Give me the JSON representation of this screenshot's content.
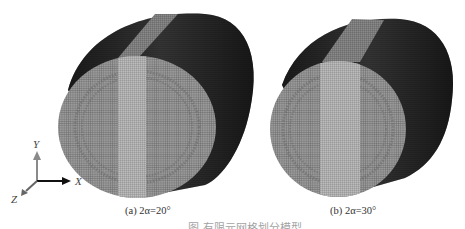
{
  "figure": {
    "panels": [
      {
        "id": "a",
        "label_prefix": "(a)",
        "label_value": "2α=20°",
        "band_angle_deg": 20
      },
      {
        "id": "b",
        "label_prefix": "(b)",
        "label_value": "2α=30°",
        "band_angle_deg": 30
      }
    ],
    "axes": {
      "y_label": "Y",
      "x_label": "X",
      "z_label": "Z"
    },
    "caption": "图 有限元网格划分模型"
  },
  "colors": {
    "background": "#ffffff",
    "side_dark": "#2a2a2a",
    "face_mesh": "#8a8a8a",
    "band_mesh": "#b0b0b0",
    "axis_y": "#888888",
    "axis_x": "#111111",
    "axis_z": "#666666"
  }
}
